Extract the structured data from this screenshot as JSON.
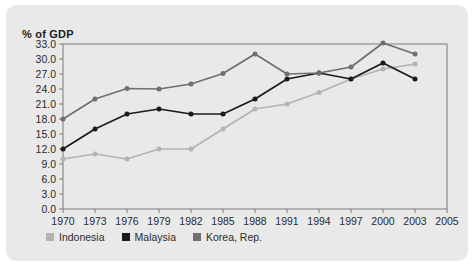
{
  "card": {
    "background": "#e9e9e9",
    "border_radius": 10
  },
  "axis_title": "% of GDP",
  "legend": {
    "items": [
      {
        "label": "Indonesia",
        "color": "#b3b3b3",
        "swatch": "square-swatch"
      },
      {
        "label": "Malaysia",
        "color": "#1a1a1a",
        "swatch": "square-swatch"
      },
      {
        "label": "Korea, Rep.",
        "color": "#6f6f6f",
        "swatch": "square-swatch"
      }
    ]
  },
  "chart_data": {
    "type": "line",
    "title": "% of GDP",
    "xlabel": "",
    "ylabel": "% of GDP",
    "x": [
      1970,
      1973,
      1976,
      1979,
      1982,
      1985,
      1988,
      1991,
      1994,
      1997,
      2000,
      2003
    ],
    "categories": [
      "1970",
      "1973",
      "1976",
      "1979",
      "1982",
      "1985",
      "1988",
      "1991",
      "1994",
      "1997",
      "2000",
      "2003"
    ],
    "xtick_labels": [
      "1970",
      "1973",
      "1976",
      "1979",
      "1982",
      "1985",
      "1988",
      "1991",
      "1994",
      "1997",
      "2000",
      "2003",
      "2005"
    ],
    "xlim": [
      1970,
      2005
    ],
    "ylim": [
      0.0,
      33.0
    ],
    "ytick_labels": [
      "0.0",
      "3.0",
      "6.0",
      "9.0",
      "12.0",
      "15.0",
      "18.0",
      "21.0",
      "24.0",
      "27.0",
      "30.0",
      "33.0"
    ],
    "yticks": [
      0.0,
      3.0,
      6.0,
      9.0,
      12.0,
      15.0,
      18.0,
      21.0,
      24.0,
      27.0,
      30.0,
      33.0
    ],
    "grid": false,
    "legend_position": "below",
    "markers": true,
    "series": [
      {
        "name": "Indonesia",
        "color": "#b3b3b3",
        "values": [
          10.0,
          11.0,
          10.0,
          12.0,
          12.0,
          16.0,
          20.0,
          21.0,
          23.3,
          26.0,
          28.0,
          29.0
        ]
      },
      {
        "name": "Malaysia",
        "color": "#1a1a1a",
        "values": [
          12.0,
          16.0,
          19.0,
          20.0,
          19.0,
          19.0,
          22.0,
          26.0,
          27.2,
          26.0,
          29.2,
          26.0
        ]
      },
      {
        "name": "Korea, Rep.",
        "color": "#6f6f6f",
        "values": [
          18.0,
          22.0,
          24.1,
          24.0,
          25.0,
          27.1,
          31.0,
          27.0,
          27.2,
          28.4,
          33.2,
          31.0
        ]
      }
    ]
  }
}
